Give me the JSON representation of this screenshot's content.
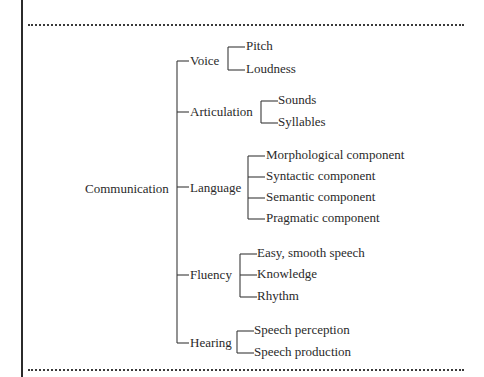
{
  "diagram": {
    "root": "Communication",
    "branches": [
      {
        "label": "Voice",
        "children": [
          "Pitch",
          "Loudness"
        ]
      },
      {
        "label": "Articulation",
        "children": [
          "Sounds",
          "Syllables"
        ]
      },
      {
        "label": "Language",
        "children": [
          "Morphological component",
          "Syntactic component",
          "Semantic component",
          "Pragmatic component"
        ]
      },
      {
        "label": "Fluency",
        "children": [
          "Easy, smooth speech",
          "Knowledge",
          "Rhythm"
        ]
      },
      {
        "label": "Hearing",
        "children": [
          "Speech perception",
          "Speech production"
        ]
      }
    ]
  },
  "colors": {
    "text": "#2a2a2a",
    "lines": "#3a3a3a",
    "background": "#ffffff"
  }
}
